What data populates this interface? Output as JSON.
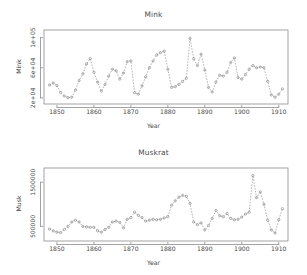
{
  "figure": {
    "background": "#ffffff",
    "foreground": "#4a4a4a",
    "point_color": "#7d7d7d",
    "line_color": "#8e8e8e",
    "frame_color": "#8c8c8c"
  },
  "panels": {
    "mink": {
      "title": "Mink",
      "xlabel": "Year",
      "ylabel": "Mink",
      "xticks": [
        "1850",
        "1860",
        "1870",
        "1880",
        "1890",
        "1900",
        "1910"
      ],
      "yticks": [
        "2e+04",
        "6e+04",
        "1e+05"
      ]
    },
    "muskrat": {
      "title": "Muskrat",
      "xlabel": "Year",
      "ylabel": "Musk",
      "xticks": [
        "1850",
        "1860",
        "1870",
        "1880",
        "1890",
        "1900",
        "1910"
      ],
      "yticks": [
        "500000",
        "1500000"
      ]
    }
  },
  "chart_data": [
    {
      "type": "line",
      "title": "Mink",
      "xlabel": "Year",
      "ylabel": "Mink",
      "xlim": [
        1846.5,
        1912.5
      ],
      "ylim": [
        12000,
        110000
      ],
      "xticks": [
        1850,
        1860,
        1870,
        1880,
        1890,
        1900,
        1910
      ],
      "yticks": [
        20000,
        60000,
        100000
      ],
      "ytick_labels": [
        "2e+04",
        "6e+04",
        "1e+05"
      ],
      "grid": false,
      "legend": "none",
      "marker": "open-circle",
      "linestyle": "dashed",
      "x": [
        1848,
        1849,
        1850,
        1851,
        1852,
        1853,
        1854,
        1855,
        1856,
        1857,
        1858,
        1859,
        1860,
        1861,
        1862,
        1863,
        1864,
        1865,
        1866,
        1867,
        1868,
        1869,
        1870,
        1871,
        1872,
        1873,
        1874,
        1875,
        1876,
        1877,
        1878,
        1879,
        1880,
        1881,
        1882,
        1883,
        1884,
        1885,
        1886,
        1887,
        1888,
        1889,
        1890,
        1891,
        1892,
        1893,
        1894,
        1895,
        1896,
        1897,
        1898,
        1899,
        1900,
        1901,
        1902,
        1903,
        1904,
        1905,
        1906,
        1907,
        1908,
        1909,
        1910,
        1911
      ],
      "values": [
        37123,
        39812,
        36400,
        27343,
        22700,
        20500,
        21000,
        30500,
        43000,
        52000,
        65000,
        72000,
        54000,
        41000,
        29000,
        38000,
        49000,
        58000,
        56000,
        45000,
        53000,
        68000,
        69000,
        27000,
        25000,
        36000,
        48000,
        60000,
        69000,
        77000,
        80000,
        82000,
        58000,
        34000,
        35000,
        38000,
        42000,
        46000,
        99000,
        72000,
        63000,
        78000,
        57000,
        34000,
        28000,
        41000,
        50000,
        49000,
        54000,
        67000,
        73000,
        47000,
        45000,
        51000,
        58000,
        63000,
        60000,
        61000,
        60000,
        42000,
        24000,
        21000,
        25000,
        32000
      ],
      "series": [
        {
          "name": "Mink",
          "values": [
            37123,
            39812,
            36400,
            27343,
            22700,
            20500,
            21000,
            30500,
            43000,
            52000,
            65000,
            72000,
            54000,
            41000,
            29000,
            38000,
            49000,
            58000,
            56000,
            45000,
            53000,
            68000,
            69000,
            27000,
            25000,
            36000,
            48000,
            60000,
            69000,
            77000,
            80000,
            82000,
            58000,
            34000,
            35000,
            38000,
            42000,
            46000,
            99000,
            72000,
            63000,
            78000,
            57000,
            34000,
            28000,
            41000,
            50000,
            49000,
            54000,
            67000,
            73000,
            47000,
            45000,
            51000,
            58000,
            63000,
            60000,
            61000,
            60000,
            42000,
            24000,
            21000,
            25000,
            32000
          ]
        }
      ]
    },
    {
      "type": "line",
      "title": "Muskrat",
      "xlabel": "Year",
      "ylabel": "Musk",
      "xlim": [
        1846.5,
        1912.5
      ],
      "ylim": [
        170000,
        1820000
      ],
      "xticks": [
        1850,
        1860,
        1870,
        1880,
        1890,
        1900,
        1910
      ],
      "yticks": [
        500000,
        1500000
      ],
      "ytick_labels": [
        "500000",
        "1500000"
      ],
      "grid": false,
      "legend": "none",
      "marker": "open-circle",
      "linestyle": "dashed",
      "x": [
        1848,
        1849,
        1850,
        1851,
        1852,
        1853,
        1854,
        1855,
        1856,
        1857,
        1858,
        1859,
        1860,
        1861,
        1862,
        1863,
        1864,
        1865,
        1866,
        1867,
        1868,
        1869,
        1870,
        1871,
        1872,
        1873,
        1874,
        1875,
        1876,
        1877,
        1878,
        1879,
        1880,
        1881,
        1882,
        1883,
        1884,
        1885,
        1886,
        1887,
        1888,
        1889,
        1890,
        1891,
        1892,
        1893,
        1894,
        1895,
        1896,
        1897,
        1898,
        1899,
        1900,
        1901,
        1902,
        1903,
        1904,
        1905,
        1906,
        1907,
        1908,
        1909,
        1910,
        1911
      ],
      "values": [
        440000,
        400000,
        370000,
        360000,
        430000,
        500000,
        600000,
        640000,
        600000,
        500000,
        490000,
        480000,
        480000,
        400000,
        370000,
        430000,
        480000,
        600000,
        620000,
        590000,
        470000,
        660000,
        700000,
        820000,
        750000,
        700000,
        620000,
        640000,
        660000,
        650000,
        660000,
        690000,
        720000,
        980000,
        1080000,
        1160000,
        1200000,
        1180000,
        1020000,
        600000,
        540000,
        580000,
        420000,
        520000,
        680000,
        860000,
        740000,
        720000,
        790000,
        680000,
        650000,
        660000,
        710000,
        780000,
        820000,
        1650000,
        1150000,
        1280000,
        1000000,
        640000,
        420000,
        350000,
        650000,
        900000
      ],
      "series": [
        {
          "name": "Muskrat",
          "values": [
            440000,
            400000,
            370000,
            360000,
            430000,
            500000,
            600000,
            640000,
            600000,
            500000,
            490000,
            480000,
            480000,
            400000,
            370000,
            430000,
            480000,
            600000,
            620000,
            590000,
            470000,
            660000,
            700000,
            820000,
            750000,
            700000,
            620000,
            640000,
            660000,
            650000,
            660000,
            690000,
            720000,
            980000,
            1080000,
            1160000,
            1200000,
            1180000,
            1020000,
            600000,
            540000,
            580000,
            420000,
            520000,
            680000,
            860000,
            740000,
            720000,
            790000,
            680000,
            650000,
            660000,
            710000,
            780000,
            820000,
            1650000,
            1150000,
            1280000,
            1000000,
            640000,
            420000,
            350000,
            650000,
            900000
          ]
        }
      ]
    }
  ]
}
